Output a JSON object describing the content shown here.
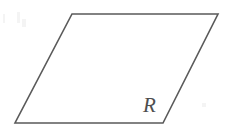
{
  "figure": {
    "kind": "geometric-diagram",
    "shape_name": "parallelogram",
    "background_color": "#ffffff",
    "stroke_color": "#5a5a5a",
    "stroke_width": 1.6,
    "label": {
      "text": "R",
      "style": "italic-serif",
      "color": "#4e4e4e",
      "font_size": 21,
      "x": 143,
      "y": 112,
      "position_description": "inside bottom-right corner"
    },
    "vertices": [
      {
        "name": "top-left",
        "x": 72,
        "y": 14
      },
      {
        "name": "top-right",
        "x": 218,
        "y": 14
      },
      {
        "name": "bottom-right",
        "x": 163,
        "y": 123
      },
      {
        "name": "bottom-left",
        "x": 15,
        "y": 123
      }
    ],
    "points_attr": "72,14 218,14 163,123 15,123",
    "edges": [
      {
        "name": "top-edge",
        "from": "top-left",
        "to": "top-right"
      },
      {
        "name": "right-edge",
        "from": "top-right",
        "to": "bottom-right"
      },
      {
        "name": "bottom-edge",
        "from": "bottom-right",
        "to": "bottom-left"
      },
      {
        "name": "left-edge",
        "from": "bottom-left",
        "to": "top-left"
      }
    ],
    "artifacts": [
      {
        "name": "scan-speck-1",
        "x": 3,
        "y": 14,
        "width": 2,
        "height": 9
      },
      {
        "name": "scan-speck-2",
        "x": 17,
        "y": 12,
        "width": 3,
        "height": 11
      },
      {
        "name": "scan-speck-3",
        "x": 22,
        "y": 19,
        "width": 4,
        "height": 8
      },
      {
        "name": "scan-speck-4",
        "x": 202,
        "y": 103,
        "width": 4,
        "height": 4
      }
    ]
  }
}
